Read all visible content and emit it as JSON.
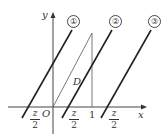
{
  "diagram": {
    "axes": {
      "x_label": "x",
      "y_label": "y",
      "origin_label": "O"
    },
    "region_label": "D",
    "tick_one_label": "1",
    "fractions": [
      {
        "numerator": "z",
        "denominator": "2",
        "sign": "-"
      },
      {
        "numerator": "z",
        "denominator": "2",
        "sign": ""
      },
      {
        "numerator": "z",
        "denominator": "2",
        "sign": ""
      }
    ],
    "lines": [
      {
        "label": "①"
      },
      {
        "label": "②"
      },
      {
        "label": "③"
      }
    ]
  }
}
